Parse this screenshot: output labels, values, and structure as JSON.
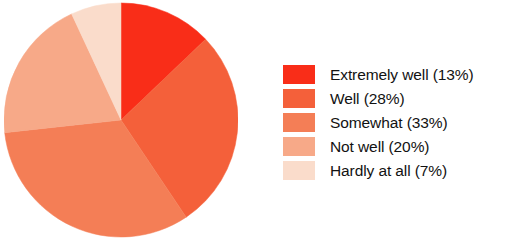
{
  "chart_data": {
    "type": "pie",
    "title": "",
    "subtitle": "",
    "xlabel": "",
    "ylabel": "",
    "legend_position": "right",
    "grid": false,
    "start_angle_deg": 0,
    "direction": "clockwise",
    "categories": [
      "Extremely well",
      "Well",
      "Somewhat",
      "Not well",
      "Hardly at all"
    ],
    "values": [
      13,
      28,
      33,
      20,
      7
    ],
    "value_unit": "%",
    "slices": [
      {
        "label": "Extremely well",
        "value": 13,
        "percent_text": "(13%)",
        "color": "#F92D18"
      },
      {
        "label": "Well",
        "value": 28,
        "percent_text": "(28%)",
        "color": "#F4603A"
      },
      {
        "label": "Somewhat",
        "value": 33,
        "percent_text": "(33%)",
        "color": "#F47E56"
      },
      {
        "label": "Not well",
        "value": 20,
        "percent_text": "(20%)",
        "color": "#F7A988"
      },
      {
        "label": "Hardly at all",
        "value": 7,
        "percent_text": "(7%)",
        "color": "#FADCCB"
      }
    ]
  },
  "legend": {
    "items": [
      {
        "label": "Extremely well (13%)",
        "color": "#F92D18",
        "swatch_name": "legend-swatch-extremely-well"
      },
      {
        "label": "Well (28%)",
        "color": "#F4603A",
        "swatch_name": "legend-swatch-well"
      },
      {
        "label": "Somewhat (33%)",
        "color": "#F47E56",
        "swatch_name": "legend-swatch-somewhat"
      },
      {
        "label": "Not well (20%)",
        "color": "#F7A988",
        "swatch_name": "legend-swatch-not-well"
      },
      {
        "label": "Hardly at all (7%)",
        "color": "#FADCCB",
        "swatch_name": "legend-swatch-hardly-at-all"
      }
    ]
  },
  "colors": {
    "background": "#FFFFFF",
    "text": "#121212",
    "accent": "#F92D18"
  }
}
